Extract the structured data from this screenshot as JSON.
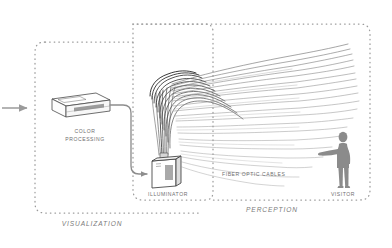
{
  "diagram": {
    "zones": [
      {
        "id": "visualization",
        "label": "VISUALIZATION",
        "style": "dashed-rounded-box"
      },
      {
        "id": "perception",
        "label": "PERCEPTION",
        "style": "dashed-rounded-box"
      },
      {
        "id": "illuminator_zone",
        "label": "",
        "style": "dashed-rounded-box"
      }
    ],
    "nodes": [
      {
        "id": "input_arrow",
        "label": "",
        "icon": "arrow-right-icon",
        "color": "#9b9b9b"
      },
      {
        "id": "color_processing",
        "label": "COLOR\nPROCESSING",
        "label_line1": "COLOR",
        "label_line2": "PROCESSING",
        "icon": "isometric-box-icon"
      },
      {
        "id": "illuminator",
        "label": "ILLUMINATOR",
        "icon": "illuminator-device-icon"
      },
      {
        "id": "fiber_optic_cables",
        "label": "FIBER OPTIC CABLES",
        "icon": "fiber-fan-icon"
      },
      {
        "id": "visitor",
        "label": "VISITOR",
        "icon": "person-silhouette-icon",
        "color": "#8b8b8b"
      }
    ],
    "connections": [
      {
        "from": "input_arrow",
        "to": "color_processing"
      },
      {
        "from": "color_processing",
        "to": "illuminator"
      },
      {
        "from": "illuminator",
        "to": "fiber_optic_cables"
      },
      {
        "from": "fiber_optic_cables",
        "to": "visitor"
      }
    ],
    "colors": {
      "background": "#ffffff",
      "dash_border": "#9a9a9a",
      "label_text": "#6f6f6f",
      "zone_text": "#7a7a7a",
      "fiber_dark": "#2b2b2b",
      "fiber_light": "#a8a8a8",
      "device_outline": "#4a4a4a",
      "silhouette": "#8b8b8b",
      "arrow": "#9b9b9b",
      "cable": "#8d8d8d"
    },
    "labels": {
      "color_processing_l1": "COLOR",
      "color_processing_l2": "PROCESSING",
      "illuminator": "ILLUMINATOR",
      "fiber_optic_cables": "FIBER OPTIC CABLES",
      "visitor": "VISITOR",
      "visualization": "VISUALIZATION",
      "perception": "PERCEPTION"
    }
  }
}
